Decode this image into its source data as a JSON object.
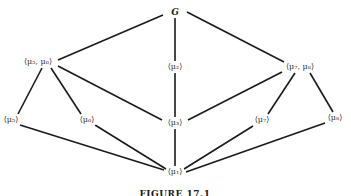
{
  "figure": {
    "caption": "FIGURE 17.1",
    "nodes": [
      {
        "id": "G",
        "label": "G",
        "x": 175,
        "y": 12
      },
      {
        "id": "m56",
        "label": "⟨μ₅, μ₆⟩",
        "x": 38,
        "y": 62
      },
      {
        "id": "m2",
        "label": "⟨μ₂⟩",
        "x": 175,
        "y": 67
      },
      {
        "id": "m78",
        "label": "⟨μ₇, μ₈⟩",
        "x": 300,
        "y": 67
      },
      {
        "id": "m5",
        "label": "⟨μ₅⟩",
        "x": 10,
        "y": 120
      },
      {
        "id": "m6",
        "label": "⟨μ₆⟩",
        "x": 87,
        "y": 120
      },
      {
        "id": "m3",
        "label": "⟨μ₃⟩",
        "x": 175,
        "y": 123
      },
      {
        "id": "m7",
        "label": "⟨μ₇⟩",
        "x": 262,
        "y": 120
      },
      {
        "id": "m8",
        "label": "⟨μ₈⟩",
        "x": 335,
        "y": 118
      },
      {
        "id": "m1",
        "label": "⟨μ₁⟩",
        "x": 175,
        "y": 172
      }
    ],
    "edges": [
      [
        "G",
        "m56"
      ],
      [
        "G",
        "m2"
      ],
      [
        "G",
        "m78"
      ],
      [
        "m56",
        "m5"
      ],
      [
        "m56",
        "m6"
      ],
      [
        "m56",
        "m3"
      ],
      [
        "m2",
        "m3"
      ],
      [
        "m78",
        "m3"
      ],
      [
        "m78",
        "m7"
      ],
      [
        "m78",
        "m8"
      ],
      [
        "m3",
        "m1"
      ],
      [
        "m5",
        "m1"
      ],
      [
        "m6",
        "m1"
      ],
      [
        "m7",
        "m1"
      ],
      [
        "m8",
        "m1"
      ]
    ]
  }
}
